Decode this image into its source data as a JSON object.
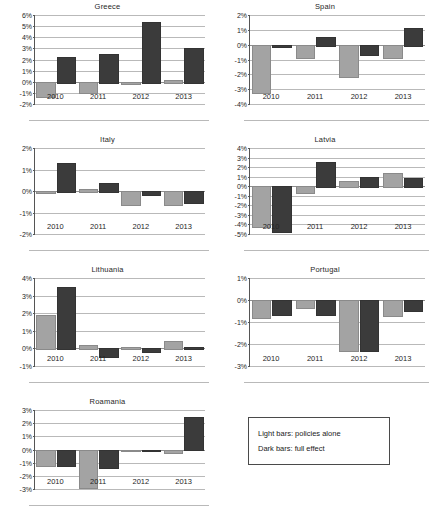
{
  "figure": {
    "legend": {
      "light_label": "Light bars: policies alone",
      "dark_label": "Dark bars: full effect"
    },
    "colors": {
      "light_bar": "#a3a3a3",
      "dark_bar": "#3b3b3b",
      "gridline": "#b9b9b9",
      "axis": "#555555"
    }
  },
  "chart_data": [
    {
      "type": "bar",
      "title": "Greece",
      "xlabel": "",
      "ylabel": "",
      "categories": [
        "2010",
        "2011",
        "2012",
        "2013"
      ],
      "ylim": [
        -2,
        6
      ],
      "yticks": [
        6,
        5,
        4,
        3,
        2,
        1,
        0,
        -1,
        -2
      ],
      "ytick_labels": [
        "6%",
        "5%",
        "4%",
        "3%",
        "2%",
        "1%",
        "0%",
        "-1%",
        "-2%"
      ],
      "grid": true,
      "series": [
        {
          "name": "policies alone",
          "values": [
            -1.3,
            -0.95,
            -0.15,
            0.2
          ]
        },
        {
          "name": "full effect",
          "values": [
            2.2,
            2.5,
            5.4,
            3.0
          ]
        }
      ]
    },
    {
      "type": "bar",
      "title": "Spain",
      "xlabel": "",
      "ylabel": "",
      "categories": [
        "2010",
        "2011",
        "2012",
        "2013"
      ],
      "ylim": [
        -4,
        2
      ],
      "yticks": [
        2,
        1,
        0,
        -1,
        -2,
        -3,
        -4
      ],
      "ytick_labels": [
        "2%",
        "1%",
        "0%",
        "-1%",
        "-2%",
        "-3%",
        "-4%"
      ],
      "grid": true,
      "series": [
        {
          "name": "policies alone",
          "values": [
            -3.2,
            -0.8,
            -2.1,
            -0.8
          ]
        },
        {
          "name": "full effect",
          "values": [
            -0.1,
            0.55,
            -0.6,
            1.1
          ]
        }
      ]
    },
    {
      "type": "bar",
      "title": "Italy",
      "xlabel": "",
      "ylabel": "",
      "categories": [
        "2010",
        "2011",
        "2012",
        "2013"
      ],
      "ylim": [
        -2,
        2
      ],
      "yticks": [
        2,
        1,
        0,
        -1,
        -2
      ],
      "ytick_labels": [
        "2%",
        "1%",
        "0%",
        "-1%",
        "-2%"
      ],
      "grid": true,
      "series": [
        {
          "name": "policies alone",
          "values": [
            -0.05,
            0.1,
            -0.6,
            -0.6
          ]
        },
        {
          "name": "full effect",
          "values": [
            1.3,
            0.35,
            -0.15,
            -0.5
          ]
        }
      ]
    },
    {
      "type": "bar",
      "title": "Latvia",
      "xlabel": "",
      "ylabel": "",
      "categories": [
        "2010",
        "2011",
        "2012",
        "2013"
      ],
      "ylim": [
        -5,
        4
      ],
      "yticks": [
        4,
        3,
        2,
        1,
        0,
        -1,
        -2,
        -3,
        -4,
        -5
      ],
      "ytick_labels": [
        "4%",
        "3%",
        "2%",
        "1%",
        "0%",
        "-1%",
        "-2%",
        "-3%",
        "-4%",
        "-5%"
      ],
      "grid": true,
      "series": [
        {
          "name": "policies alone",
          "values": [
            -4.15,
            -0.65,
            0.5,
            1.4
          ]
        },
        {
          "name": "full effect",
          "values": [
            -4.7,
            2.55,
            1.0,
            0.9
          ]
        }
      ]
    },
    {
      "type": "bar",
      "title": "Lithuania",
      "xlabel": "",
      "ylabel": "",
      "categories": [
        "2010",
        "2011",
        "2012",
        "2013"
      ],
      "ylim": [
        -1,
        4
      ],
      "yticks": [
        4,
        3,
        2,
        1,
        0,
        -1
      ],
      "ytick_labels": [
        "4%",
        "3%",
        "2%",
        "1%",
        "0%",
        "-1%"
      ],
      "grid": true,
      "series": [
        {
          "name": "policies alone",
          "values": [
            1.9,
            0.2,
            0.1,
            0.4
          ]
        },
        {
          "name": "full effect",
          "values": [
            3.5,
            -0.45,
            -0.15,
            0.1
          ]
        }
      ]
    },
    {
      "type": "bar",
      "title": "Portugal",
      "xlabel": "",
      "ylabel": "",
      "categories": [
        "2010",
        "2011",
        "2012",
        "2013"
      ],
      "ylim": [
        -3,
        1
      ],
      "yticks": [
        1,
        0,
        -1,
        -2,
        -3
      ],
      "ytick_labels": [
        "1%",
        "0%",
        "-1%",
        "-2%",
        "-3%"
      ],
      "grid": true,
      "series": [
        {
          "name": "policies alone",
          "values": [
            -0.75,
            -0.3,
            -2.25,
            -0.7
          ]
        },
        {
          "name": "full effect",
          "values": [
            -0.65,
            -0.65,
            -2.25,
            -0.45
          ]
        }
      ]
    },
    {
      "type": "bar",
      "title": "Roamania",
      "xlabel": "",
      "ylabel": "",
      "categories": [
        "2010",
        "2011",
        "2012",
        "2013"
      ],
      "ylim": [
        -3,
        3
      ],
      "yticks": [
        3,
        2,
        1,
        0,
        -1,
        -2,
        -3
      ],
      "ytick_labels": [
        "3%",
        "2%",
        "1%",
        "0%",
        "-1%",
        "-2%",
        "-3%"
      ],
      "grid": true,
      "series": [
        {
          "name": "policies alone",
          "values": [
            -1.15,
            -2.85,
            -0.02,
            -0.2
          ]
        },
        {
          "name": "full effect",
          "values": [
            -1.15,
            -1.35,
            -0.02,
            2.45
          ]
        }
      ]
    }
  ]
}
